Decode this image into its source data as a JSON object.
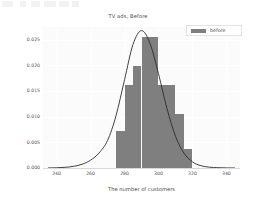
{
  "figure": {
    "title": "TV ads, Before",
    "background_color": "#ffffff",
    "plot_background_color": "#fbfbfb",
    "bar_color": "#7f7f7f",
    "curve_color": "#2b2b2b",
    "grid_color": "#ffffff"
  },
  "topbar": {
    "ghost_segments": [
      {
        "left": 2,
        "width": 11
      },
      {
        "left": 20,
        "width": 6
      },
      {
        "left": 31,
        "width": 9
      },
      {
        "left": 44,
        "width": 12
      },
      {
        "left": 59,
        "width": 10
      },
      {
        "left": 72,
        "width": 7
      }
    ]
  },
  "legend": {
    "label": "before",
    "swatch_color": "#7f7f7f"
  },
  "axes": {
    "xlabel": "The number of customers",
    "ylabel": "",
    "xticks": [
      240,
      260,
      280,
      300,
      320,
      340
    ],
    "xtick_labels": [
      "240",
      "260",
      "280",
      "300",
      "320",
      "340"
    ],
    "yticks": [
      0.0,
      0.005,
      0.01,
      0.015,
      0.02,
      0.025
    ],
    "ytick_labels": [
      "0.000",
      "0.005",
      "0.010",
      "0.015",
      "0.020",
      "0.025"
    ],
    "xlim": [
      232,
      348
    ],
    "ylim": [
      0.0,
      0.0275
    ]
  },
  "chart_data": {
    "type": "bar",
    "title": "TV ads, Before",
    "xlabel": "The number of customers",
    "ylabel": "",
    "xlim": [
      232,
      348
    ],
    "ylim": [
      0.0,
      0.0275
    ],
    "grid": true,
    "legend_position": "upper right",
    "bin_edges": [
      275,
      280,
      285,
      290,
      295,
      300,
      305,
      310,
      315,
      320
    ],
    "bin_centers": [
      277.5,
      282.5,
      287.5,
      292.5,
      297.5,
      302.5,
      307.5,
      312.5,
      317.5
    ],
    "categories": [
      "275-280",
      "280-285",
      "285-290",
      "290-295",
      "295-300",
      "300-305",
      "305-310",
      "310-315",
      "315-320"
    ],
    "values": [
      0.0073,
      0.0162,
      0.0199,
      0.0256,
      0.0256,
      0.0162,
      0.0162,
      0.0106,
      0.0037
    ],
    "series": [
      {
        "name": "before",
        "type": "histogram",
        "values": [
          0.0073,
          0.0162,
          0.0199,
          0.0256,
          0.0256,
          0.0162,
          0.0162,
          0.0106,
          0.0037
        ]
      },
      {
        "name": "kde",
        "type": "line",
        "x": [
          235,
          240,
          245,
          250,
          255,
          260,
          265,
          270,
          275,
          280,
          285,
          290,
          295,
          300,
          305,
          310,
          315,
          320,
          325,
          330,
          335,
          340,
          345
        ],
        "y": [
          2e-05,
          5e-05,
          0.00013,
          0.00032,
          0.00073,
          0.00152,
          0.00293,
          0.00536,
          0.0102,
          0.0172,
          0.0241,
          0.0268,
          0.0243,
          0.0184,
          0.0116,
          0.0062,
          0.0029,
          0.0012,
          0.00045,
          0.00016,
          6e-05,
          2e-05,
          1e-05
        ]
      }
    ]
  }
}
